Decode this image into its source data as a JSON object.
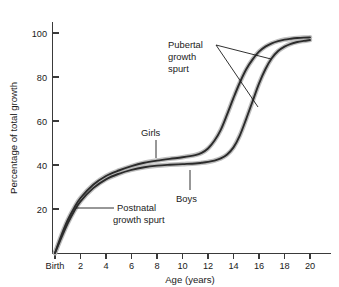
{
  "chart_data": {
    "type": "line",
    "title": "",
    "xlabel": "Age (years)",
    "ylabel": "Percentage of total growth",
    "xlim": [
      0,
      21
    ],
    "ylim": [
      0,
      108
    ],
    "grid": false,
    "legend": "inline-annotations",
    "x_ticks": [
      {
        "value": 0,
        "label": "Birth"
      },
      {
        "value": 2,
        "label": "2"
      },
      {
        "value": 4,
        "label": "4"
      },
      {
        "value": 6,
        "label": "6"
      },
      {
        "value": 8,
        "label": "8"
      },
      {
        "value": 10,
        "label": "10"
      },
      {
        "value": 12,
        "label": "12"
      },
      {
        "value": 14,
        "label": "14"
      },
      {
        "value": 16,
        "label": "16"
      },
      {
        "value": 18,
        "label": "18"
      },
      {
        "value": 20,
        "label": "20"
      }
    ],
    "y_ticks": [
      {
        "value": 20,
        "label": "20"
      },
      {
        "value": 40,
        "label": "40"
      },
      {
        "value": 60,
        "label": "60"
      },
      {
        "value": 80,
        "label": "80"
      },
      {
        "value": 100,
        "label": "100"
      }
    ],
    "x": [
      0,
      0.5,
      1,
      1.5,
      2,
      3,
      4,
      5,
      6,
      7,
      8,
      9,
      10,
      11,
      11.5,
      12,
      12.5,
      13,
      13.5,
      14,
      14.5,
      15,
      15.5,
      16,
      16.5,
      17,
      17.5,
      18,
      18.5,
      19,
      19.5,
      20
    ],
    "series": [
      {
        "name": "Girls",
        "color": "#2b2b2b",
        "values": [
          0,
          8,
          15,
          20.5,
          25,
          31,
          35,
          37.5,
          39.5,
          41,
          42,
          42.8,
          43.5,
          44.5,
          45.5,
          47.5,
          51,
          56,
          63,
          70.5,
          77.5,
          83.5,
          88,
          91.5,
          93.8,
          95.3,
          96.3,
          97,
          97.4,
          97.7,
          97.9,
          98
        ]
      },
      {
        "name": "Boys",
        "color": "#2b2b2b",
        "values": [
          0,
          7,
          13.5,
          19,
          23.5,
          29.5,
          33.5,
          36,
          37.8,
          39,
          39.7,
          40.1,
          40.4,
          40.7,
          41,
          41.4,
          42,
          43,
          44.8,
          48,
          53.5,
          61,
          69,
          77,
          83.5,
          88.5,
          91.8,
          93.8,
          95.1,
          95.9,
          96.4,
          96.8
        ]
      }
    ],
    "annotations": [
      {
        "id": "pubertal",
        "lines": [
          "Pubertal",
          "growth",
          "spurt"
        ]
      },
      {
        "id": "postnatal",
        "lines": [
          "Postnatal",
          "growth spurt"
        ]
      },
      {
        "id": "girls",
        "lines": [
          "Girls"
        ]
      },
      {
        "id": "boys",
        "lines": [
          "Boys"
        ]
      }
    ]
  }
}
